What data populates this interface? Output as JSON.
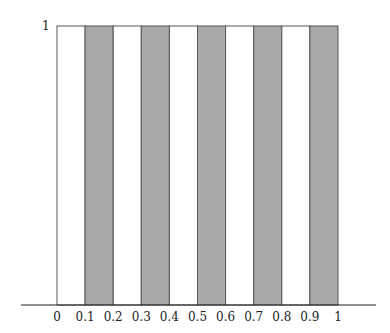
{
  "chart_data": {
    "type": "bar",
    "title": "",
    "xlabel": "",
    "ylabel": "",
    "xlim": [
      0,
      1
    ],
    "ylim": [
      0,
      1
    ],
    "x_ticks": [
      "0",
      "0.1",
      "0.2",
      "0.3",
      "0.4",
      "0.5",
      "0.6",
      "0.7",
      "0.8",
      "0.9",
      "1"
    ],
    "y_ticks": [
      "1"
    ],
    "grid": false,
    "intervals": [
      {
        "from": 0.0,
        "to": 0.1,
        "value": 1,
        "fill": "white"
      },
      {
        "from": 0.1,
        "to": 0.2,
        "value": 1,
        "fill": "gray"
      },
      {
        "from": 0.2,
        "to": 0.3,
        "value": 1,
        "fill": "white"
      },
      {
        "from": 0.3,
        "to": 0.4,
        "value": 1,
        "fill": "gray"
      },
      {
        "from": 0.4,
        "to": 0.5,
        "value": 1,
        "fill": "white"
      },
      {
        "from": 0.5,
        "to": 0.6,
        "value": 1,
        "fill": "gray"
      },
      {
        "from": 0.6,
        "to": 0.7,
        "value": 1,
        "fill": "white"
      },
      {
        "from": 0.7,
        "to": 0.8,
        "value": 1,
        "fill": "gray"
      },
      {
        "from": 0.8,
        "to": 0.9,
        "value": 1,
        "fill": "white"
      },
      {
        "from": 0.9,
        "to": 1.0,
        "value": 1,
        "fill": "gray"
      }
    ]
  },
  "colors": {
    "gray_fill": "#a9a9a9",
    "white_fill": "#ffffff",
    "stroke": "#555555",
    "axis": "#222222"
  }
}
